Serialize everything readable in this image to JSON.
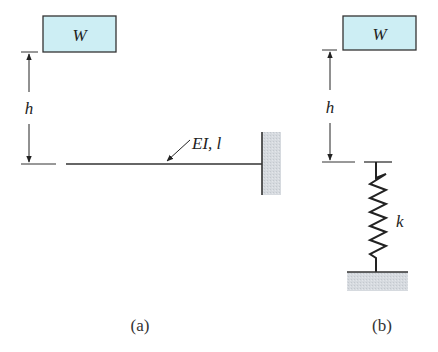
{
  "figure": {
    "panels": [
      {
        "id": "a",
        "caption": "(a)",
        "weight_label": "W",
        "height_label": "h",
        "beam_label": "EI, l",
        "support": "fixed-wall"
      },
      {
        "id": "b",
        "caption": "(b)",
        "weight_label": "W",
        "height_label": "h",
        "spring_label": "k",
        "support": "ground"
      }
    ],
    "colors": {
      "weight_fill": "#cdeef4",
      "support_fill": "#d5d9de",
      "line": "#333333"
    }
  }
}
